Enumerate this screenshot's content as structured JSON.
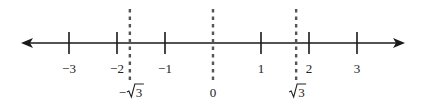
{
  "diagram": {
    "type": "number-line",
    "range": [
      -3.4,
      3.7
    ],
    "colors": {
      "axis": "#1a1a1a",
      "tick": "#1a1a1a",
      "dashed_marker": "#555555",
      "text": "#222222"
    },
    "ticks": [
      {
        "value": -3,
        "label": "−3"
      },
      {
        "value": -2,
        "label": "−2"
      },
      {
        "value": -1,
        "label": "−1"
      },
      {
        "value": 1,
        "label": "1"
      },
      {
        "value": 2,
        "label": "2"
      },
      {
        "value": 3,
        "label": "3"
      }
    ],
    "markers": [
      {
        "value": -1.7320508,
        "label_prefix": "−",
        "label_radicand": "3",
        "radical": true,
        "name": "neg-sqrt3"
      },
      {
        "value": 0,
        "label_prefix": "",
        "label_radicand": "0",
        "radical": false,
        "name": "zero"
      },
      {
        "value": 1.7320508,
        "label_prefix": "",
        "label_radicand": "3",
        "radical": true,
        "name": "sqrt3"
      }
    ],
    "arrows": [
      "left",
      "right"
    ]
  }
}
